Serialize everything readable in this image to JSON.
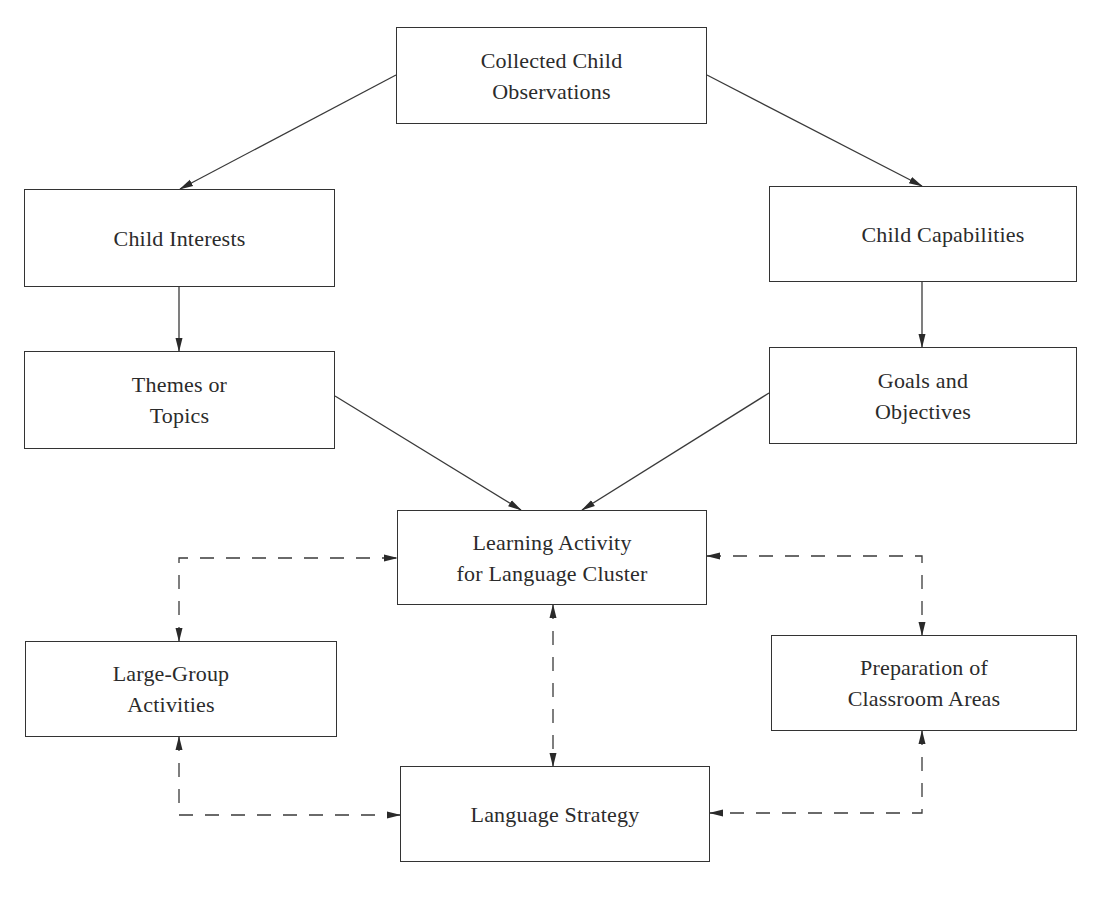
{
  "diagram": {
    "type": "flowchart",
    "nodes": {
      "observations": {
        "label": "Collected Child\nObservations"
      },
      "interests": {
        "label": "Child Interests"
      },
      "capabilities": {
        "label": "Child Capabilities"
      },
      "themes": {
        "label": "Themes or\nTopics"
      },
      "goals": {
        "label": "Goals and\nObjectives"
      },
      "learning_activity": {
        "label": "Learning Activity\nfor Language Cluster"
      },
      "large_group": {
        "label": "Large-Group\nActivities"
      },
      "classroom_areas": {
        "label": "Preparation of\nClassroom Areas"
      },
      "language_strategy": {
        "label": "Language Strategy"
      }
    },
    "edges": [
      {
        "from": "observations",
        "to": "interests",
        "style": "solid"
      },
      {
        "from": "observations",
        "to": "capabilities",
        "style": "solid"
      },
      {
        "from": "interests",
        "to": "themes",
        "style": "solid"
      },
      {
        "from": "capabilities",
        "to": "goals",
        "style": "solid"
      },
      {
        "from": "themes",
        "to": "learning_activity",
        "style": "solid"
      },
      {
        "from": "goals",
        "to": "learning_activity",
        "style": "solid"
      },
      {
        "from": "learning_activity",
        "to": "large_group",
        "style": "dashed",
        "bidirectional": true
      },
      {
        "from": "learning_activity",
        "to": "classroom_areas",
        "style": "dashed",
        "bidirectional": true
      },
      {
        "from": "learning_activity",
        "to": "language_strategy",
        "style": "dashed",
        "bidirectional": true
      },
      {
        "from": "large_group",
        "to": "language_strategy",
        "style": "dashed",
        "bidirectional": true
      },
      {
        "from": "classroom_areas",
        "to": "language_strategy",
        "style": "dashed",
        "bidirectional": true
      }
    ],
    "colors": {
      "line": "#333333",
      "text": "#2b2b2b",
      "background": "#ffffff"
    }
  }
}
